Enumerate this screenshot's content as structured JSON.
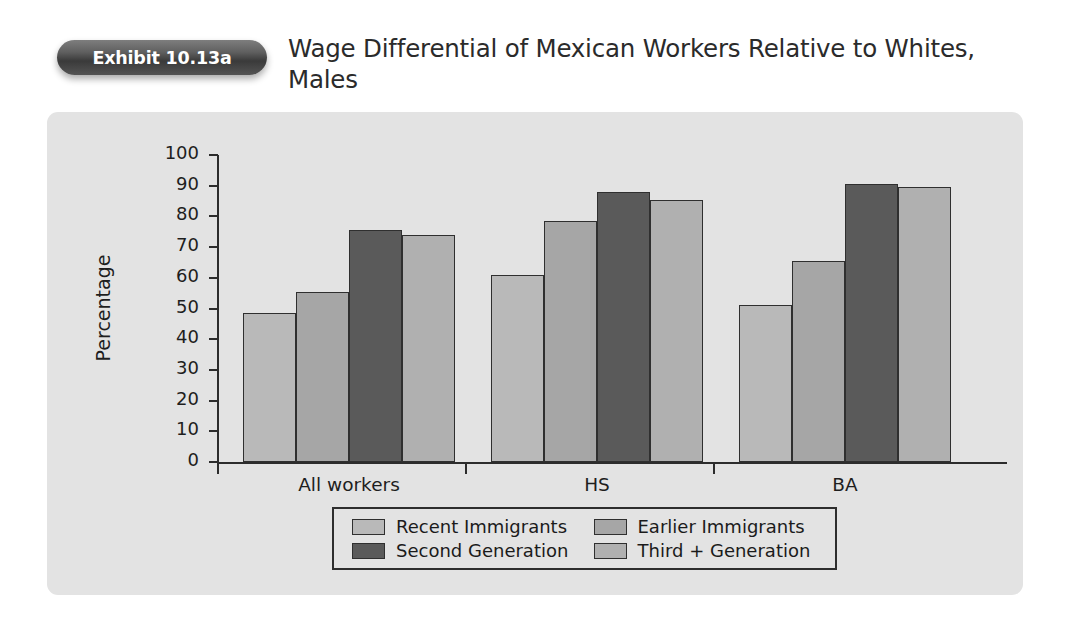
{
  "exhibit": {
    "badge_label": "Exhibit 10.13a"
  },
  "header": {
    "title": "Wage Differential of Mexican Workers Relative to Whites, Males"
  },
  "colors": {
    "panel_background": "#e3e3e3",
    "page_background": "#ffffff",
    "axis": "#2c2c2c",
    "bar_outline": "#2f2f2f",
    "series_recent_immigrants": "#b9b9b9",
    "series_earlier_immigrants": "#a6a6a6",
    "series_second_generation": "#5a5a5a",
    "series_third_plus_generation": "#b0b0b0",
    "badge_text": "#ffffff"
  },
  "chart_data": {
    "type": "bar",
    "title": "Wage Differential of Mexican Workers Relative to Whites, Males",
    "xlabel": "",
    "ylabel": "Percentage",
    "ylim": [
      0,
      100
    ],
    "ytick_step": 10,
    "yticks": [
      0,
      10,
      20,
      30,
      40,
      50,
      60,
      70,
      80,
      90,
      100
    ],
    "grid": false,
    "legend_position": "bottom-center",
    "categories": [
      "All workers",
      "HS",
      "BA"
    ],
    "series": [
      {
        "name": "Recent Immigrants",
        "color": "#b9b9b9",
        "values": [
          48.5,
          61.0,
          51.0
        ]
      },
      {
        "name": "Earlier Immigrants",
        "color": "#a6a6a6",
        "values": [
          55.5,
          78.5,
          65.5
        ]
      },
      {
        "name": "Second Generation",
        "color": "#5a5a5a",
        "values": [
          75.5,
          88.0,
          90.5
        ]
      },
      {
        "name": "Third + Generation",
        "color": "#b0b0b0",
        "values": [
          74.0,
          85.5,
          89.5
        ]
      }
    ]
  }
}
